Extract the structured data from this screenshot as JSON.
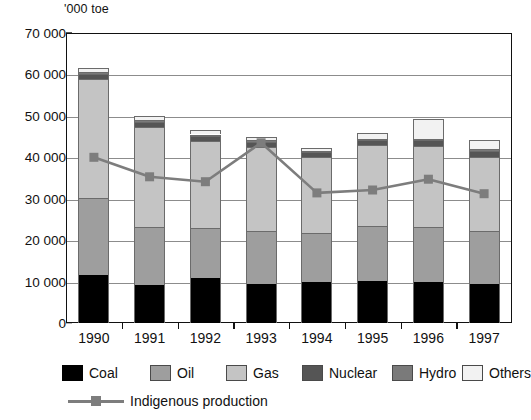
{
  "chart_data": {
    "type": "bar",
    "subtype": "stacked-bar-with-line",
    "title": "",
    "xlabel": "",
    "ylabel": "'000 toe",
    "unit_caption": "'000 toe",
    "ylim": [
      0,
      70000
    ],
    "ytick_values": [
      0,
      10000,
      20000,
      30000,
      40000,
      50000,
      60000,
      70000
    ],
    "ytick_labels": [
      "0",
      "10 000",
      "20 000",
      "30 000",
      "40 000",
      "50 000",
      "60 000",
      "70 000"
    ],
    "grid": true,
    "grid_axis": "y",
    "categories": [
      "1990",
      "1991",
      "1992",
      "1993",
      "1994",
      "1995",
      "1996",
      "1997"
    ],
    "series": [
      {
        "name": "Coal",
        "color": "#000000",
        "values": [
          11600,
          9200,
          10800,
          9500,
          9900,
          10200,
          10000,
          9300
        ]
      },
      {
        "name": "Oil",
        "color": "#9e9e9e",
        "values": [
          18600,
          13900,
          12100,
          12700,
          11900,
          13100,
          13100,
          12900
        ]
      },
      {
        "name": "Gas",
        "color": "#c4c4c4",
        "values": [
          28800,
          24300,
          21000,
          20400,
          18300,
          19600,
          19700,
          17800
        ]
      },
      {
        "name": "Nuclear",
        "color": "#555555",
        "values": [
          1200,
          1200,
          1300,
          1200,
          1100,
          1200,
          1300,
          1500
        ]
      },
      {
        "name": "Hydro",
        "color": "#7a7a7a",
        "values": [
          300,
          300,
          300,
          300,
          300,
          300,
          300,
          400
        ]
      },
      {
        "name": "Others",
        "color": "#f2f2f2",
        "values": [
          1000,
          1100,
          1000,
          900,
          700,
          1400,
          4900,
          2300
        ]
      }
    ],
    "totals": [
      61500,
      50000,
      46500,
      45000,
      42200,
      45800,
      49300,
      44200
    ],
    "line_series": {
      "name": "Indigenous production",
      "color": "#7d7d7d",
      "marker": "square",
      "values": [
        40000,
        35300,
        34100,
        43500,
        31400,
        32100,
        34700,
        31200
      ]
    },
    "legend": {
      "position": "bottom",
      "entries": [
        {
          "label": "Coal",
          "color": "#000000",
          "type": "swatch"
        },
        {
          "label": "Oil",
          "color": "#9e9e9e",
          "type": "swatch"
        },
        {
          "label": "Gas",
          "color": "#c4c4c4",
          "type": "swatch"
        },
        {
          "label": "Nuclear",
          "color": "#555555",
          "type": "swatch"
        },
        {
          "label": "Hydro",
          "color": "#7a7a7a",
          "type": "swatch"
        },
        {
          "label": "Others",
          "color": "#f2f2f2",
          "type": "swatch"
        },
        {
          "label": "Indigenous production",
          "color": "#7d7d7d",
          "type": "line"
        }
      ]
    }
  }
}
